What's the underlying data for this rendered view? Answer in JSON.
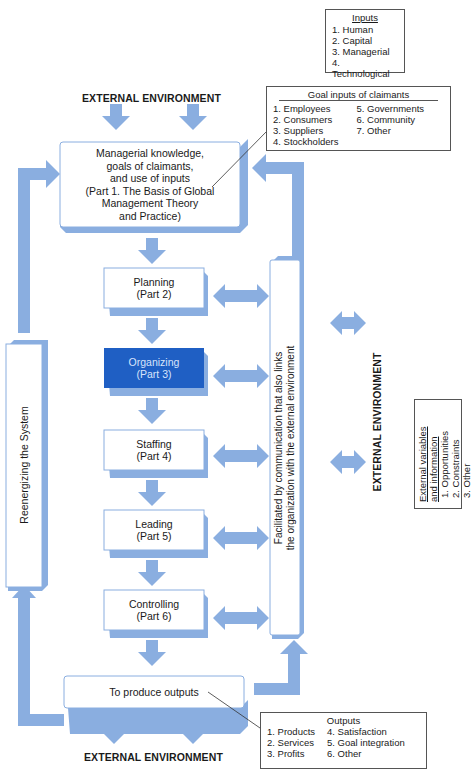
{
  "colors": {
    "arrow": "#8aaee0",
    "shadow": "#8aaee0",
    "highlight_box": "#1f5fc4",
    "highlight_text": "#ffffff",
    "box_border": "#8aaee0",
    "legend_border": "#555555"
  },
  "environment_labels": {
    "top": "EXTERNAL ENVIRONMENT",
    "right": "EXTERNAL ENVIRONMENT",
    "bottom": "EXTERNAL ENVIRONMENT"
  },
  "inputs_legend": {
    "title": "Inputs",
    "items": [
      "1. Human",
      "2. Capital",
      "3. Managerial",
      "4. Technological"
    ]
  },
  "claimants_legend": {
    "title": "Goal inputs of claimants",
    "col1": [
      "1. Employees",
      "2. Consumers",
      "3. Suppliers",
      "4. Stockholders"
    ],
    "col2": [
      "5. Governments",
      "6. Community",
      "7. Other"
    ]
  },
  "external_variables_legend": {
    "title_line1": "External variables",
    "title_line2": "and information",
    "items": [
      "1. Opportunities",
      "2. Constraints",
      "3. Other"
    ]
  },
  "outputs_legend": {
    "title": "Outputs",
    "col1": [
      "1. Products",
      "2. Services",
      "3. Profits"
    ],
    "col2": [
      "4. Satisfaction",
      "5. Goal integration",
      "6. Other"
    ]
  },
  "input_box": {
    "lines": [
      "Managerial knowledge,",
      "goals of claimants,",
      "and use of inputs",
      "(Part 1. The Basis of Global",
      "Management Theory",
      "and Practice)"
    ]
  },
  "functions": [
    {
      "name": "Planning",
      "part": "(Part 2)",
      "highlighted": false
    },
    {
      "name": "Organizing",
      "part": "(Part 3)",
      "highlighted": true
    },
    {
      "name": "Staffing",
      "part": "(Part 4)",
      "highlighted": false
    },
    {
      "name": "Leading",
      "part": "(Part 5)",
      "highlighted": false
    },
    {
      "name": "Controlling",
      "part": "(Part 6)",
      "highlighted": false
    }
  ],
  "communication_box": {
    "line1": "Facilitated by communication that also links",
    "line2": "the organization with the external environment"
  },
  "reenergizing_box": {
    "label": "Reenergizing the System"
  },
  "output_box": {
    "label": "To produce outputs"
  }
}
